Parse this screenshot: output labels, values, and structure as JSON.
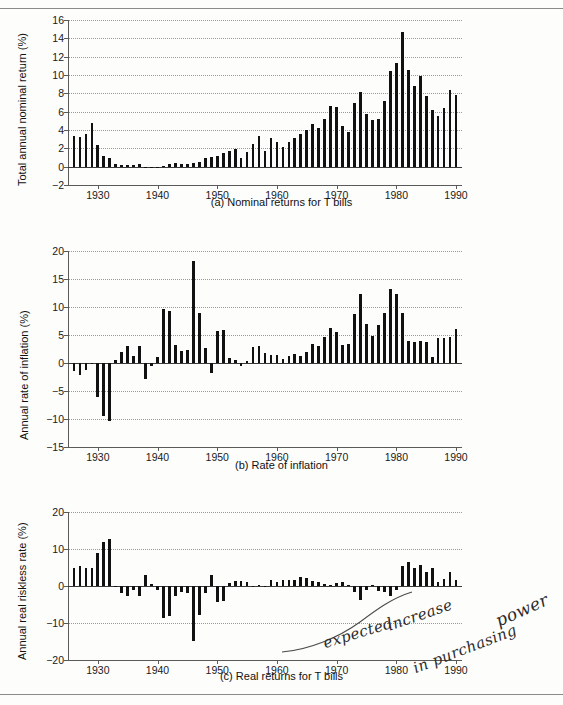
{
  "figure": {
    "title_rules": {
      "top": "horizontal-rule",
      "bottom": "horizontal-rule"
    },
    "annotation": {
      "line1": "expected",
      "line2": "increase",
      "line3": "in purchasing",
      "line4": "power",
      "full_text": "expected increase in purchasing power",
      "style": "handwritten"
    }
  },
  "colors": {
    "bar": "#111111",
    "axis": "#5a5a5a",
    "grid": "#9a9a9a",
    "page": "#fdfdfc",
    "text": "#1a1a1a"
  },
  "panels": [
    {
      "id": "a",
      "caption": "(a)  Nominal returns for T bills"
    },
    {
      "id": "b",
      "caption": "(b)  Rate of inflation"
    },
    {
      "id": "c",
      "caption": "(c)  Real returns for T bills"
    }
  ],
  "chart_data": [
    {
      "type": "bar",
      "title": "(a)  Nominal returns for T bills",
      "xlabel": "",
      "ylabel": "Total annual nominal return (%)",
      "ylim": [
        -2,
        16
      ],
      "yticks": [
        -2,
        0,
        2,
        4,
        6,
        8,
        10,
        12,
        14,
        16
      ],
      "ytick_labels": [
        "-2",
        "0",
        "2",
        "4",
        "6",
        "8",
        "10",
        "12",
        "14",
        "16"
      ],
      "xlim": [
        1925,
        1991
      ],
      "xticks": [
        1930,
        1940,
        1950,
        1960,
        1970,
        1980,
        1990
      ],
      "xtick_labels": [
        "1930",
        "1940",
        "1950",
        "1960",
        "1970",
        "1980",
        "1990"
      ],
      "grid": true,
      "legend": "none",
      "x": [
        1926,
        1927,
        1928,
        1929,
        1930,
        1931,
        1932,
        1933,
        1934,
        1935,
        1936,
        1937,
        1938,
        1939,
        1940,
        1941,
        1942,
        1943,
        1944,
        1945,
        1946,
        1947,
        1948,
        1949,
        1950,
        1951,
        1952,
        1953,
        1954,
        1955,
        1956,
        1957,
        1958,
        1959,
        1960,
        1961,
        1962,
        1963,
        1964,
        1965,
        1966,
        1967,
        1968,
        1969,
        1970,
        1971,
        1972,
        1973,
        1974,
        1975,
        1976,
        1977,
        1978,
        1979,
        1980,
        1981,
        1982,
        1983,
        1984,
        1985,
        1986,
        1987,
        1988,
        1989,
        1990
      ],
      "values": [
        3.3,
        3.2,
        3.6,
        4.8,
        2.4,
        1.2,
        1.0,
        0.3,
        0.2,
        0.2,
        0.2,
        0.3,
        0.0,
        0.0,
        0.0,
        0.1,
        0.3,
        0.4,
        0.3,
        0.3,
        0.4,
        0.5,
        0.9,
        1.1,
        1.2,
        1.5,
        1.7,
        1.9,
        0.9,
        1.6,
        2.5,
        3.3,
        1.7,
        3.1,
        2.7,
        2.2,
        2.7,
        3.1,
        3.6,
        4.0,
        4.7,
        4.2,
        5.2,
        6.6,
        6.5,
        4.4,
        3.8,
        7.0,
        8.1,
        5.8,
        5.1,
        5.2,
        7.2,
        10.4,
        11.3,
        14.7,
        10.5,
        8.8,
        9.9,
        7.7,
        6.2,
        5.5,
        6.4,
        8.4,
        7.8
      ]
    },
    {
      "type": "bar",
      "title": "(b)  Rate of inflation",
      "xlabel": "",
      "ylabel": "Annual rate of inflation (%)",
      "ylim": [
        -15,
        20
      ],
      "yticks": [
        -15,
        -10,
        -5,
        0,
        5,
        10,
        15,
        20
      ],
      "ytick_labels": [
        "-15",
        "-10",
        "-5",
        "0",
        "5",
        "10",
        "15",
        "20"
      ],
      "xlim": [
        1925,
        1991
      ],
      "xticks": [
        1930,
        1940,
        1950,
        1960,
        1970,
        1980,
        1990
      ],
      "xtick_labels": [
        "1930",
        "1940",
        "1950",
        "1960",
        "1970",
        "1980",
        "1990"
      ],
      "grid": true,
      "legend": "none",
      "x": [
        1926,
        1927,
        1928,
        1929,
        1930,
        1931,
        1932,
        1933,
        1934,
        1935,
        1936,
        1937,
        1938,
        1939,
        1940,
        1941,
        1942,
        1943,
        1944,
        1945,
        1946,
        1947,
        1948,
        1949,
        1950,
        1951,
        1952,
        1953,
        1954,
        1955,
        1956,
        1957,
        1958,
        1959,
        1960,
        1961,
        1962,
        1963,
        1964,
        1965,
        1966,
        1967,
        1968,
        1969,
        1970,
        1971,
        1972,
        1973,
        1974,
        1975,
        1976,
        1977,
        1978,
        1979,
        1980,
        1981,
        1982,
        1983,
        1984,
        1985,
        1986,
        1987,
        1988,
        1989,
        1990
      ],
      "values": [
        -1.5,
        -2.2,
        -1.2,
        -0.1,
        -6.0,
        -9.5,
        -10.3,
        0.5,
        2.0,
        3.0,
        1.2,
        3.1,
        -2.8,
        -0.5,
        1.0,
        9.7,
        9.3,
        3.2,
        2.1,
        2.3,
        18.2,
        9.0,
        2.7,
        -1.8,
        5.8,
        5.9,
        0.9,
        0.6,
        -0.5,
        0.4,
        2.9,
        3.0,
        1.8,
        1.5,
        1.5,
        0.7,
        1.2,
        1.6,
        1.2,
        1.9,
        3.4,
        3.0,
        4.7,
        6.2,
        5.6,
        3.3,
        3.4,
        8.7,
        12.3,
        6.9,
        4.9,
        6.7,
        9.0,
        13.3,
        12.4,
        8.9,
        3.9,
        3.8,
        4.0,
        3.8,
        1.1,
        4.4,
        4.4,
        4.6,
        6.1
      ]
    },
    {
      "type": "bar",
      "title": "(c)  Real returns for T bills",
      "xlabel": "",
      "ylabel": "Annual real riskless rate (%)",
      "ylim": [
        -20,
        20
      ],
      "yticks": [
        -20,
        -10,
        0,
        10,
        20
      ],
      "ytick_labels": [
        "-20",
        "-10",
        "0",
        "10",
        "20"
      ],
      "xlim": [
        1925,
        1991
      ],
      "xticks": [
        1930,
        1940,
        1950,
        1960,
        1970,
        1980,
        1990
      ],
      "xtick_labels": [
        "1930",
        "1940",
        "1950",
        "1960",
        "1970",
        "1980",
        "1990"
      ],
      "grid": true,
      "legend": "none",
      "x": [
        1926,
        1927,
        1928,
        1929,
        1930,
        1931,
        1932,
        1933,
        1934,
        1935,
        1936,
        1937,
        1938,
        1939,
        1940,
        1941,
        1942,
        1943,
        1944,
        1945,
        1946,
        1947,
        1948,
        1949,
        1950,
        1951,
        1952,
        1953,
        1954,
        1955,
        1956,
        1957,
        1958,
        1959,
        1960,
        1961,
        1962,
        1963,
        1964,
        1965,
        1966,
        1967,
        1968,
        1969,
        1970,
        1971,
        1972,
        1973,
        1974,
        1975,
        1976,
        1977,
        1978,
        1979,
        1980,
        1981,
        1982,
        1983,
        1984,
        1985,
        1986,
        1987,
        1988,
        1989,
        1990
      ],
      "values": [
        4.9,
        5.5,
        4.9,
        4.9,
        8.8,
        11.8,
        12.6,
        -0.2,
        -1.8,
        -2.7,
        -1.0,
        -2.7,
        3.0,
        0.5,
        -1.0,
        -8.7,
        -8.0,
        -2.7,
        -1.7,
        -1.9,
        -14.9,
        -7.8,
        -1.8,
        3.0,
        -4.3,
        -4.1,
        0.8,
        1.3,
        1.4,
        1.2,
        0.0,
        0.3,
        -0.1,
        1.6,
        1.2,
        1.5,
        1.5,
        1.5,
        2.4,
        2.1,
        1.3,
        1.2,
        0.5,
        0.4,
        0.9,
        1.1,
        0.4,
        -1.5,
        -3.7,
        -1.0,
        0.2,
        -1.4,
        -1.7,
        -2.6,
        -1.0,
        5.4,
        6.4,
        4.9,
        5.6,
        3.8,
        5.0,
        1.1,
        1.9,
        3.7,
        1.7
      ]
    }
  ]
}
